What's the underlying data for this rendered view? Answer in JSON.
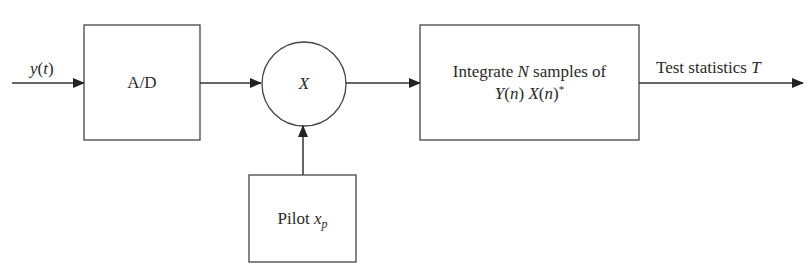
{
  "diagram": {
    "type": "block-diagram",
    "input": {
      "label": "y",
      "arg": "t"
    },
    "blocks": [
      {
        "id": "ad",
        "label": "A/D"
      },
      {
        "id": "multiplier",
        "label": "X"
      },
      {
        "id": "pilot",
        "label": "Pilot",
        "var": "x",
        "sub": "p"
      },
      {
        "id": "integrate",
        "line1_prefix": "Integrate ",
        "line1_var": "N",
        "line1_suffix": " samples of",
        "line2_y": "Y",
        "line2_n1": "n",
        "line2_x": "X",
        "line2_n2": "n",
        "line2_sup": "*"
      }
    ],
    "output": {
      "label": "Test statistics ",
      "var": "T"
    },
    "edges": [
      {
        "from": "input",
        "to": "ad"
      },
      {
        "from": "ad",
        "to": "multiplier"
      },
      {
        "from": "pilot",
        "to": "multiplier"
      },
      {
        "from": "multiplier",
        "to": "integrate"
      },
      {
        "from": "integrate",
        "to": "output"
      }
    ],
    "colors": {
      "stroke": "#333333",
      "background": "#ffffff"
    }
  }
}
